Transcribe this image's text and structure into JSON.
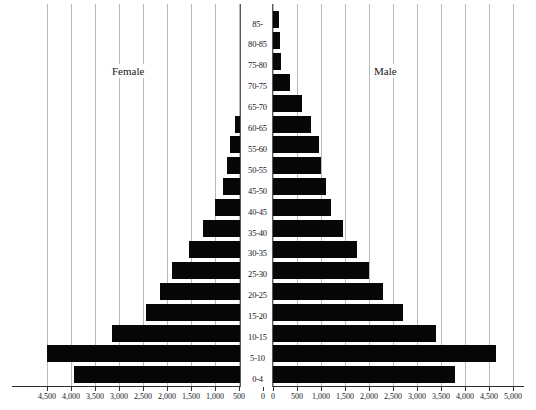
{
  "chart_data": {
    "type": "bar",
    "subtype": "population-pyramid",
    "title": "",
    "xlabel": "",
    "ylabel": "",
    "orientation": "horizontal",
    "grid": true,
    "legend_position": "inside-plot",
    "categories": [
      "0-4",
      "5-10",
      "10-15",
      "15-20",
      "20-25",
      "25-30",
      "30-35",
      "35-40",
      "40-45",
      "45-50",
      "50-55",
      "55-60",
      "60-65",
      "65-70",
      "70-75",
      "75-80",
      "80-85",
      "85-"
    ],
    "axis": {
      "left_max": 4500,
      "right_max": 5000,
      "tick_step": 500,
      "left_ticks": [
        4500,
        4000,
        3500,
        3000,
        2500,
        2000,
        1500,
        1000,
        500,
        0
      ],
      "right_ticks": [
        0,
        500,
        1000,
        1500,
        2000,
        2500,
        3000,
        3500,
        4000,
        4500,
        5000
      ],
      "left_tick_labels": [
        "4,500",
        "4,000",
        "3,500",
        "3,000",
        "2,500",
        "2,000",
        "1,500",
        "1,000",
        "500",
        "0"
      ],
      "right_tick_labels": [
        "0",
        "500",
        "1,000",
        "1,500",
        "2,000",
        "2,500",
        "3,000",
        "3,500",
        "4,000",
        "4,500",
        "5,000"
      ]
    },
    "series": [
      {
        "name": "Female",
        "side": "left",
        "color": "#070707",
        "values": [
          4150,
          4700,
          3350,
          2650,
          2350,
          2100,
          1750,
          1450,
          1200,
          1050,
          950,
          900,
          800,
          600,
          350,
          175,
          150,
          130
        ]
      },
      {
        "name": "Male",
        "side": "right",
        "color": "#070707",
        "values": [
          3800,
          4650,
          3400,
          2700,
          2300,
          2000,
          1750,
          1450,
          1200,
          1100,
          1000,
          950,
          800,
          600,
          350,
          175,
          150,
          130
        ]
      }
    ]
  },
  "labels": {
    "female": "Female",
    "male": "Male"
  },
  "colors": {
    "bar": "#070707",
    "gridline": "#b9b9b9",
    "axis": "#2b2b2b",
    "text": "#15151a",
    "background": "#ffffff"
  }
}
